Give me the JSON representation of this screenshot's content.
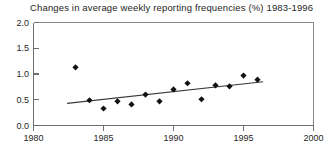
{
  "chart_data": {
    "type": "scatter",
    "title": "Changes in average weekly reporting frequencies (%) 1983-1996",
    "xlabel": "",
    "ylabel": "",
    "xlim": [
      1980,
      2000
    ],
    "ylim": [
      0.0,
      2.0
    ],
    "grid": false,
    "legend": "none",
    "xticks": [
      "1980",
      "1985",
      "1990",
      "1995",
      "2000"
    ],
    "xtick_values": [
      1980,
      1985,
      1990,
      1995,
      2000
    ],
    "yticks": [
      "0.0",
      "0.5",
      "1.0",
      "1.5",
      "2.0"
    ],
    "ytick_values": [
      0.0,
      0.5,
      1.0,
      1.5,
      2.0
    ],
    "marker": "filled-diamond",
    "marker_color": "#111111",
    "x": [
      1983,
      1984,
      1985,
      1986,
      1987,
      1988,
      1989,
      1990,
      1991,
      1992,
      1993,
      1994,
      1995,
      1996
    ],
    "values": [
      1.13,
      0.49,
      0.33,
      0.47,
      0.41,
      0.6,
      0.47,
      0.7,
      0.82,
      0.51,
      0.78,
      0.76,
      0.97,
      0.89
    ],
    "points": [
      {
        "x": 1983,
        "y": 1.13
      },
      {
        "x": 1984,
        "y": 0.49
      },
      {
        "x": 1985,
        "y": 0.33
      },
      {
        "x": 1986,
        "y": 0.47
      },
      {
        "x": 1987,
        "y": 0.41
      },
      {
        "x": 1988,
        "y": 0.6
      },
      {
        "x": 1989,
        "y": 0.47
      },
      {
        "x": 1990,
        "y": 0.7
      },
      {
        "x": 1991,
        "y": 0.82
      },
      {
        "x": 1992,
        "y": 0.51
      },
      {
        "x": 1993,
        "y": 0.78
      },
      {
        "x": 1994,
        "y": 0.76
      },
      {
        "x": 1995,
        "y": 0.97
      },
      {
        "x": 1996,
        "y": 0.89
      }
    ],
    "trend_line": {
      "name": "linear trend",
      "x_start": 1982.4,
      "y_start": 0.43,
      "x_end": 1996.4,
      "y_end": 0.85,
      "color": "#3a3a3a"
    }
  }
}
